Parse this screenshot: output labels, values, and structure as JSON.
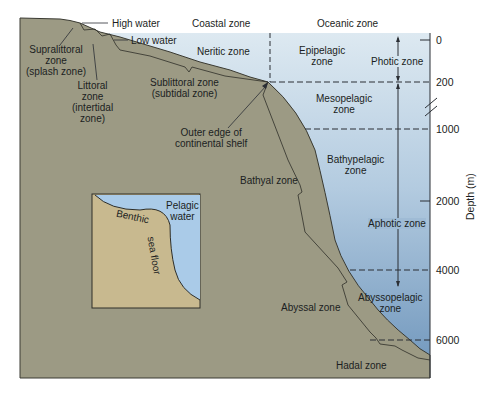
{
  "figure": {
    "colors": {
      "land": "#9b9a83",
      "land_edge": "#3a3a32",
      "water_top": "#dbe9f2",
      "water_bottom": "#6f97bd",
      "inset_land": "#c8b98f",
      "inset_water": "#aacbe8",
      "text": "#1b1e22"
    },
    "top_headers": {
      "coastal": "Coastal zone",
      "oceanic": "Oceanic zone"
    },
    "shore_labels": {
      "high_water": "High water",
      "low_water": "Low water",
      "supralittoral": [
        "Supralittoral",
        "zone",
        "(splash zone)"
      ],
      "littoral": [
        "Littoral",
        "zone",
        "(intertidal",
        "zone)"
      ],
      "sublittoral": [
        "Sublittoral zone",
        "(subtidal zone)"
      ],
      "shelf_edge": [
        "Outer edge of",
        "continental shelf"
      ]
    },
    "benthic_zones": {
      "bathyal": "Bathyal zone",
      "abyssal": "Abyssal zone",
      "hadal": "Hadal zone"
    },
    "pelagic_zones": {
      "neritic": "Neritic zone",
      "epipelagic": [
        "Epipelagic",
        "zone"
      ],
      "mesopelagic": [
        "Mesopelagic",
        "zone"
      ],
      "bathypelagic": [
        "Bathypelagic",
        "zone"
      ],
      "abyssopelagic": [
        "Abyssopelagic",
        "zone"
      ]
    },
    "light_zones": {
      "photic": "Photic zone",
      "aphotic": "Aphotic zone"
    },
    "depth_axis": {
      "title": "Depth (m)",
      "ticks": [
        "0",
        "200",
        "1000",
        "2000",
        "4000",
        "6000"
      ],
      "break_between": [
        "200",
        "1000"
      ]
    },
    "inset": {
      "pelagic": [
        "Pelagic",
        "water"
      ],
      "benthic": "Benthic",
      "sea_floor": "sea floor"
    }
  }
}
